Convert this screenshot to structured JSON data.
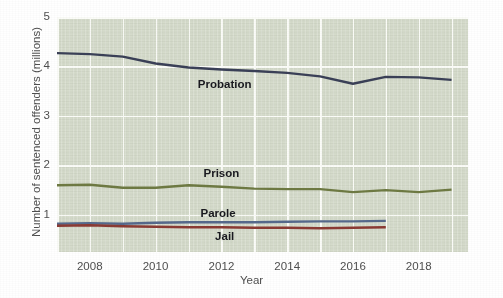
{
  "chart_data": {
    "type": "line",
    "title": "",
    "subtitle": "",
    "xlabel": "Year",
    "ylabel": "Number of sentenced offenders (millions)",
    "xlim": [
      2007,
      2019.5
    ],
    "ylim": [
      0.25,
      5.0
    ],
    "xticks": [
      2008,
      2010,
      2012,
      2014,
      2016,
      2018
    ],
    "xtick_labels": [
      "2008",
      "2010",
      "2012",
      "2014",
      "2016",
      "2018"
    ],
    "yticks": [
      1,
      2,
      3,
      4,
      5
    ],
    "ytick_labels": [
      "1",
      "2",
      "3",
      "4",
      "5"
    ],
    "grid": "both-major-white-on-sage-panel",
    "legend_position": "inline-data-labels",
    "panel_background": "#d5dbcb",
    "grid_color": "#fbfcf8",
    "x": [
      2007,
      2008,
      2009,
      2010,
      2011,
      2012,
      2013,
      2014,
      2015,
      2016,
      2017,
      2018,
      2019
    ],
    "series": [
      {
        "name": "Probation",
        "color": "#3a4057",
        "label_x": 2012.1,
        "label_y": 3.62,
        "values": [
          4.27,
          4.25,
          4.2,
          4.06,
          3.98,
          3.94,
          3.91,
          3.87,
          3.8,
          3.65,
          3.79,
          3.78,
          3.73
        ]
      },
      {
        "name": "Prison",
        "color": "#6e7a43",
        "label_x": 2012.0,
        "label_y": 1.83,
        "values": [
          1.6,
          1.61,
          1.55,
          1.55,
          1.6,
          1.57,
          1.53,
          1.52,
          1.52,
          1.46,
          1.5,
          1.46,
          1.51
        ]
      },
      {
        "name": "Parole",
        "color": "#56698c",
        "label_x": 2011.9,
        "label_y": 1.02,
        "values": [
          0.82,
          0.83,
          0.82,
          0.84,
          0.85,
          0.85,
          0.85,
          0.86,
          0.87,
          0.87,
          0.88,
          null,
          null
        ]
      },
      {
        "name": "Jail",
        "color": "#8b3a33",
        "label_x": 2012.1,
        "label_y": 0.56,
        "values": [
          0.78,
          0.79,
          0.77,
          0.76,
          0.75,
          0.75,
          0.74,
          0.74,
          0.73,
          0.74,
          0.75,
          null,
          null
        ]
      }
    ]
  }
}
